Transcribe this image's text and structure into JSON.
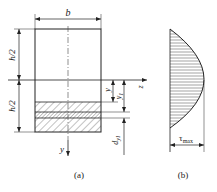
{
  "figure_a": {
    "caption": "(a)",
    "width_label": "b",
    "upper_half_label": "h/2",
    "lower_half_label": "h/2",
    "y_label": "y",
    "y1_label": "y",
    "y1_sub": "1",
    "dy1_label": "d",
    "dy1_sub": "y1",
    "axis_z_label": "z",
    "axis_y_label": "y"
  },
  "figure_b": {
    "caption": "(b)",
    "tau_label": "τ",
    "tau_sub": "max"
  },
  "colors": {
    "line": "#222222",
    "background": "#ffffff"
  }
}
